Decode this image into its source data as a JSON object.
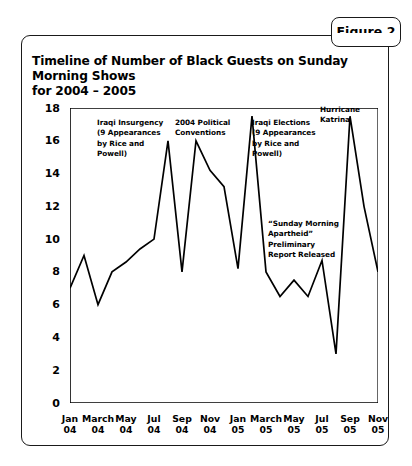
{
  "figure": {
    "tab_label": "Figure 2"
  },
  "chart_title_line1": "Timeline of Number of Black Guests on Sunday Morning Shows",
  "chart_title_line2": "for 2004 – 2005",
  "chart_data": {
    "type": "line",
    "title": "Timeline of Number of Black Guests on Sunday Morning Shows for 2004 – 2005",
    "xlabel": "",
    "ylabel": "",
    "ylim": [
      0,
      18
    ],
    "ytick_step": 2,
    "yticks": [
      "0",
      "2",
      "4",
      "6",
      "8",
      "10",
      "12",
      "14",
      "16",
      "18"
    ],
    "grid": false,
    "legend": "none",
    "x": [
      "Jan 04",
      "Feb 04",
      "March 04",
      "Apr 04",
      "May 04",
      "Jun 04",
      "Jul 04",
      "Aug 04",
      "Sep 04",
      "Oct 04",
      "Nov 04",
      "Dec 04",
      "Jan 05",
      "Feb 05",
      "March 05",
      "Apr 05",
      "May 05",
      "Jun 05",
      "Jul 05",
      "Aug 05",
      "Sep 05",
      "Oct 05",
      "Nov 05"
    ],
    "xtick_labels": [
      {
        "month": "Jan",
        "year": "04"
      },
      {
        "month": "March",
        "year": "04"
      },
      {
        "month": "May",
        "year": "04"
      },
      {
        "month": "Jul",
        "year": "04"
      },
      {
        "month": "Sep",
        "year": "04"
      },
      {
        "month": "Nov",
        "year": "04"
      },
      {
        "month": "Jan",
        "year": "05"
      },
      {
        "month": "March",
        "year": "05"
      },
      {
        "month": "May",
        "year": "05"
      },
      {
        "month": "Jul",
        "year": "05"
      },
      {
        "month": "Sep",
        "year": "05"
      },
      {
        "month": "Nov",
        "year": "05"
      }
    ],
    "values": [
      7.0,
      9.0,
      6.0,
      8.0,
      8.6,
      9.4,
      10.0,
      16.0,
      8.0,
      16.0,
      14.2,
      13.2,
      8.2,
      17.5,
      8.0,
      6.5,
      7.5,
      6.5,
      8.7,
      3.0,
      17.5,
      12.0,
      8.0
    ],
    "line_color": "#000000",
    "annotations": [
      {
        "id": "iraqi-insurgency",
        "text": "Iraqi Insurgency\n(9 Appearances\nby Rice and\nPowell)"
      },
      {
        "id": "political-conventions",
        "text": "2004 Political\nConventions"
      },
      {
        "id": "iraqi-elections",
        "text": "Iraqi Elections\n(9 Appearances\nby Rice and\nPowell)"
      },
      {
        "id": "sunday-morning-apartheid",
        "text": "“Sunday Morning\nApartheid” Preliminary\nReport Released"
      },
      {
        "id": "hurricane-katrina",
        "text": "Hurricane\nKatrina"
      }
    ]
  }
}
